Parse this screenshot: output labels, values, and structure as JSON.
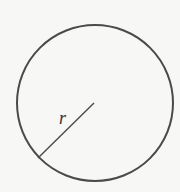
{
  "diagram": {
    "type": "circle-with-radius",
    "circle": {
      "cx": 95,
      "cy": 103,
      "r": 78,
      "stroke": "#4a4a4a",
      "stroke_width": 2
    },
    "radius_line": {
      "x1": 94,
      "y1": 103,
      "x2": 38,
      "y2": 158,
      "stroke": "#4a4a4a",
      "stroke_width": 1.4
    },
    "radius_label": "r",
    "background": "#f7f7f5"
  }
}
